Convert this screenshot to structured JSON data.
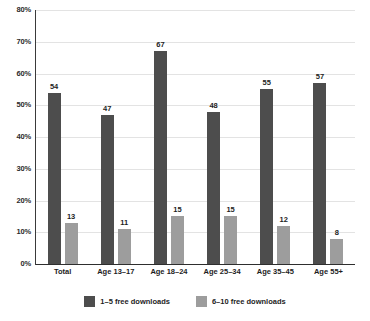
{
  "chart_data": {
    "type": "bar",
    "title": "",
    "xlabel": "",
    "ylabel": "",
    "categories": [
      "Total",
      "Age 13–17",
      "Age 18–24",
      "Age 25–34",
      "Age 35–45",
      "Age 55+"
    ],
    "series": [
      {
        "name": "1–5 free downloads",
        "color": "#4d4d4d",
        "values": [
          54,
          47,
          67,
          48,
          55,
          57
        ]
      },
      {
        "name": "6–10 free downloads",
        "color": "#9d9d9d",
        "values": [
          13,
          11,
          15,
          15,
          12,
          8
        ]
      }
    ],
    "ylim": [
      0,
      80
    ],
    "ytick_values": [
      80,
      70,
      60,
      50,
      40,
      30,
      20,
      10,
      0
    ],
    "ytick_labels": [
      "80%",
      "70%",
      "60%",
      "50%",
      "40%",
      "30%",
      "20%",
      "10%",
      "0%"
    ],
    "grid": true,
    "grid_color": "#e3e3e3",
    "legend_position": "bottom",
    "data_labels": true,
    "background_color": "#ffffff"
  }
}
